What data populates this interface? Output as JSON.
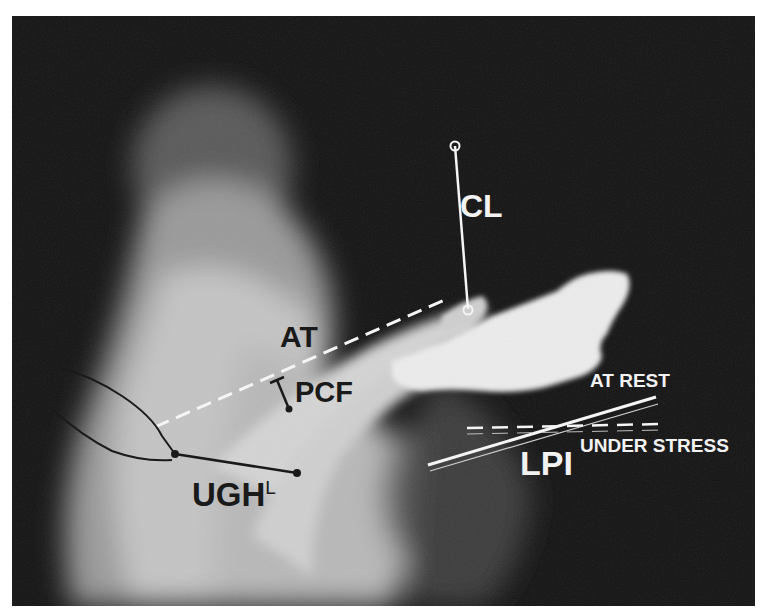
{
  "figure": {
    "type": "lateral chain cystourethrogram (radiograph) with annotated measurements",
    "labels": {
      "cl": "CL",
      "at": "AT",
      "pcf": "PCF",
      "ugh": "UGH",
      "ugh_sub": "L",
      "lpi": "LPI",
      "at_rest": "AT REST",
      "under_stress": "UNDER STRESS"
    },
    "colors": {
      "background_dark": "#141414",
      "tissue_light": "#d8d8d8",
      "contrast_bright": "#efefef",
      "annotation_light": "#f5f5f5",
      "annotation_dark": "#1a1a1a"
    }
  }
}
